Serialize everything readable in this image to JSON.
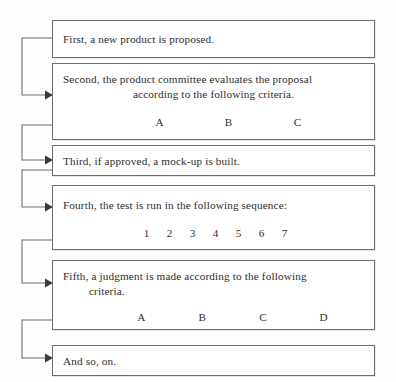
{
  "diagram": {
    "title_fragment": "",
    "colors": {
      "background": "#fefefe",
      "box_border": "#6d6d6d",
      "text": "#2d2d2d",
      "connector": "#6d6d6d",
      "arrowhead": "#3a3a3a"
    },
    "boxes": [
      {
        "id": "box-first",
        "line1": "First, a new product is proposed.",
        "line2": "",
        "labels": []
      },
      {
        "id": "box-second",
        "line1": "Second, the product committee evaluates the proposal",
        "line2": "according to the following criteria.",
        "labels": [
          "A",
          "B",
          "C"
        ]
      },
      {
        "id": "box-third",
        "line1": "Third, if approved, a mock-up is built.",
        "line2": "",
        "labels": []
      },
      {
        "id": "box-fourth",
        "line1": "Fourth, the test is run in the following sequence:",
        "line2": "",
        "labels": [
          "1",
          "2",
          "3",
          "4",
          "5",
          "6",
          "7"
        ]
      },
      {
        "id": "box-fifth",
        "line1": "Fifth, a judgment is made according to the following",
        "line2": "criteria.",
        "labels": [
          "A",
          "B",
          "C",
          "D"
        ]
      },
      {
        "id": "box-and-so-on",
        "line1": "And so, on.",
        "line2": "",
        "labels": []
      }
    ]
  }
}
